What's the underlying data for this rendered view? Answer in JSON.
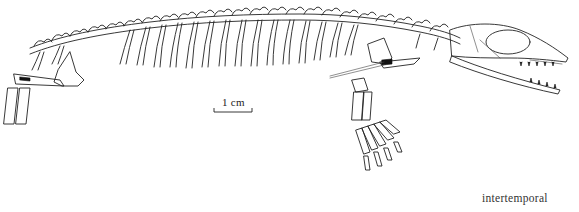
{
  "figure": {
    "scale_bar": {
      "label": "1 cm"
    },
    "caption_label": "intertemporal"
  }
}
